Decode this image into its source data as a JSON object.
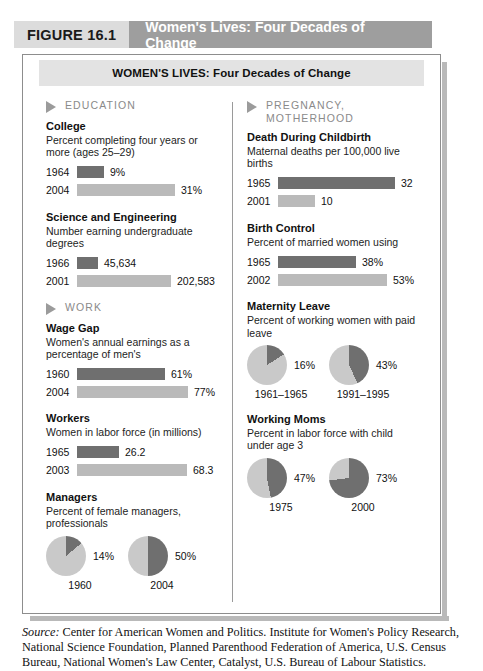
{
  "figure": {
    "label": "FIGURE 16.1",
    "title": "Women's Lives: Four Decades of Change",
    "banner": "WOMEN'S LIVES: Four Decades of Change"
  },
  "colors": {
    "bar_dark": "#6f6f6f",
    "bar_light": "#bababa",
    "pie_base": "#c9c9c9",
    "pie_slice": "#6f6f6f",
    "header_band": "#9e9e9e",
    "header_label": "#dcdcdc",
    "banner": "#e3e3e3"
  },
  "left_column": {
    "sections": [
      {
        "heading": "EDUCATION",
        "blocks": [
          {
            "title": "College",
            "subtitle": "Percent completing four years or more (ages 25–29)",
            "type": "bars",
            "rows": [
              {
                "year": "1964",
                "value": 9,
                "display": "9%",
                "width": 27,
                "shade": "dark"
              },
              {
                "year": "2004",
                "value": 31,
                "display": "31%",
                "width": 98,
                "shade": "light"
              }
            ]
          },
          {
            "title": "Science and Engineering",
            "subtitle": "Number earning undergraduate degrees",
            "type": "bars",
            "rows": [
              {
                "year": "1966",
                "value": 45634,
                "display": "45,634",
                "width": 21,
                "shade": "dark"
              },
              {
                "year": "2001",
                "value": 202583,
                "display": "202,583",
                "width": 94,
                "shade": "light"
              }
            ]
          }
        ]
      },
      {
        "heading": "WORK",
        "blocks": [
          {
            "title": "Wage Gap",
            "subtitle": "Women's annual earnings as a percentage of men's",
            "type": "bars",
            "rows": [
              {
                "year": "1960",
                "value": 61,
                "display": "61%",
                "width": 88,
                "shade": "dark"
              },
              {
                "year": "2004",
                "value": 77,
                "display": "77%",
                "width": 111,
                "shade": "light"
              }
            ]
          },
          {
            "title": "Workers",
            "subtitle": "Women in labor force (in millions)",
            "type": "bars",
            "rows": [
              {
                "year": "1965",
                "value": 26.2,
                "display": "26.2",
                "width": 42,
                "shade": "dark"
              },
              {
                "year": "2003",
                "value": 68.3,
                "display": "68.3",
                "width": 110,
                "shade": "light"
              }
            ]
          },
          {
            "title": "Managers",
            "subtitle": "Percent of female managers, professionals",
            "type": "pies",
            "pies": [
              {
                "label": "1960",
                "value": 14,
                "display": "14%"
              },
              {
                "label": "2004",
                "value": 50,
                "display": "50%"
              }
            ]
          }
        ]
      }
    ]
  },
  "right_column": {
    "sections": [
      {
        "heading": "PREGNANCY, MOTHERHOOD",
        "blocks": [
          {
            "title": "Death During Childbirth",
            "subtitle": "Maternal deaths per 100,000 live births",
            "type": "bars",
            "rows": [
              {
                "year": "1965",
                "value": 32,
                "display": "32",
                "width": 117,
                "shade": "dark"
              },
              {
                "year": "2001",
                "value": 10,
                "display": "10",
                "width": 37,
                "shade": "light"
              }
            ]
          },
          {
            "title": "Birth Control",
            "subtitle": "Percent of married women using",
            "type": "bars",
            "rows": [
              {
                "year": "1965",
                "value": 38,
                "display": "38%",
                "width": 78,
                "shade": "dark"
              },
              {
                "year": "2002",
                "value": 53,
                "display": "53%",
                "width": 109,
                "shade": "light"
              }
            ]
          },
          {
            "title": "Maternity Leave",
            "subtitle": "Percent of working women with paid leave",
            "type": "pies",
            "pies": [
              {
                "label": "1961–1965",
                "value": 16,
                "display": "16%"
              },
              {
                "label": "1991–1995",
                "value": 43,
                "display": "43%"
              }
            ]
          },
          {
            "title": "Working Moms",
            "subtitle": "Percent in labor force with child under age 3",
            "type": "pies",
            "pies": [
              {
                "label": "1975",
                "value": 47,
                "display": "47%"
              },
              {
                "label": "2000",
                "value": 73,
                "display": "73%"
              }
            ]
          }
        ]
      }
    ]
  },
  "source": {
    "prefix": "Source:",
    "text": " Center for American Women and Politics. Institute for Women's Policy Research, National Science Foundation, Planned Parenthood Federation of America, U.S. Census Bureau, National Women's Law Center, Catalyst, U.S. Bureau of Labour Statistics."
  }
}
